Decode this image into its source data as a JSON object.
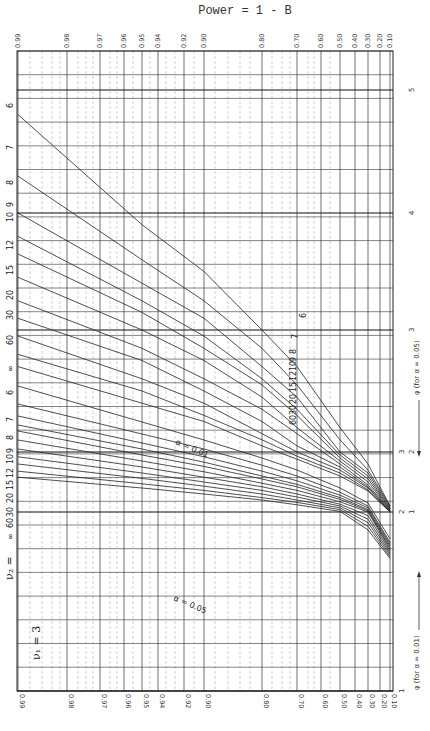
{
  "title": "Power = 1 - B",
  "nu1_label": "ν₁ = 3",
  "nu2_label": "ν₂ = ∞ 60 30 20 15 12 10 9 8 7 6",
  "alpha_05_label": "α = 0.05",
  "alpha_01_label": "α = 0.01",
  "phi_05_label": "φ (for α = 0.05)",
  "phi_01_label": "φ (for α = 0.01)",
  "colors": {
    "line": "#222222",
    "grid_major": "#333333",
    "grid_minor": "#888888",
    "background": "#ffffff"
  },
  "chart_data": {
    "type": "line",
    "subtitle": "Pearson–Hartley power chart, ν₁ = 3 (rotated 90°)",
    "xlabel": "Power = 1 - β",
    "ylabel": "φ",
    "power_ticks_top": [
      "0.99",
      "0.98",
      "0.97",
      "0.96",
      "0.95",
      "0.94",
      "0.92",
      "0.90",
      "0.80",
      "0.70",
      "0.60",
      "0.50",
      "0.40",
      "0.30",
      "0.20",
      "0.10"
    ],
    "power_ticks_bottom": [
      "0.99",
      "0.98",
      "0.97",
      "0.96",
      "0.95",
      "0.94",
      "0.92",
      "0.90",
      "0.80",
      "0.70",
      "0.60",
      "0.50",
      "0.40",
      "0.30",
      "0.20",
      "0.10"
    ],
    "phi_ticks_alpha_01": [
      "1",
      "2",
      "3"
    ],
    "phi_ticks_alpha_05": [
      "1",
      "2",
      "3",
      "4",
      "5"
    ],
    "nu1": 3,
    "nu2_values": [
      "6",
      "7",
      "8",
      "9",
      "10",
      "12",
      "15",
      "20",
      "30",
      "60",
      "∞"
    ],
    "series_groups": [
      {
        "alpha": 0.05,
        "label": "α = 0.05",
        "series": [
          {
            "name": "6",
            "points": [
              [
                0.99,
                4.8
              ],
              [
                0.95,
                3.9
              ],
              [
                0.9,
                3.5
              ],
              [
                0.8,
                3.0
              ],
              [
                0.7,
                2.7
              ],
              [
                0.5,
                2.2
              ],
              [
                0.3,
                1.8
              ],
              [
                0.1,
                1.1
              ]
            ]
          },
          {
            "name": "7",
            "points": [
              [
                0.99,
                4.3
              ],
              [
                0.95,
                3.6
              ],
              [
                0.9,
                3.25
              ],
              [
                0.8,
                2.85
              ],
              [
                0.7,
                2.55
              ],
              [
                0.5,
                2.1
              ],
              [
                0.3,
                1.7
              ],
              [
                0.1,
                1.1
              ]
            ]
          },
          {
            "name": "8",
            "points": [
              [
                0.99,
                4.0
              ],
              [
                0.95,
                3.4
              ],
              [
                0.9,
                3.1
              ],
              [
                0.8,
                2.7
              ],
              [
                0.7,
                2.45
              ],
              [
                0.5,
                2.0
              ],
              [
                0.3,
                1.65
              ],
              [
                0.1,
                1.08
              ]
            ]
          },
          {
            "name": "9",
            "points": [
              [
                0.99,
                3.8
              ],
              [
                0.95,
                3.25
              ],
              [
                0.9,
                2.95
              ],
              [
                0.8,
                2.6
              ],
              [
                0.7,
                2.35
              ],
              [
                0.5,
                1.95
              ],
              [
                0.3,
                1.6
              ],
              [
                0.1,
                1.06
              ]
            ]
          },
          {
            "name": "10",
            "points": [
              [
                0.99,
                3.65
              ],
              [
                0.95,
                3.15
              ],
              [
                0.9,
                2.85
              ],
              [
                0.8,
                2.55
              ],
              [
                0.7,
                2.3
              ],
              [
                0.5,
                1.9
              ],
              [
                0.3,
                1.55
              ],
              [
                0.1,
                1.05
              ]
            ]
          },
          {
            "name": "12",
            "points": [
              [
                0.99,
                3.45
              ],
              [
                0.95,
                3.0
              ],
              [
                0.9,
                2.75
              ],
              [
                0.8,
                2.45
              ],
              [
                0.7,
                2.2
              ],
              [
                0.5,
                1.85
              ],
              [
                0.3,
                1.5
              ],
              [
                0.1,
                1.04
              ]
            ]
          },
          {
            "name": "15",
            "points": [
              [
                0.99,
                3.25
              ],
              [
                0.95,
                2.85
              ],
              [
                0.9,
                2.6
              ],
              [
                0.8,
                2.35
              ],
              [
                0.7,
                2.15
              ],
              [
                0.5,
                1.8
              ],
              [
                0.3,
                1.45
              ],
              [
                0.1,
                1.03
              ]
            ]
          },
          {
            "name": "20",
            "points": [
              [
                0.99,
                3.1
              ],
              [
                0.95,
                2.75
              ],
              [
                0.9,
                2.5
              ],
              [
                0.8,
                2.25
              ],
              [
                0.7,
                2.05
              ],
              [
                0.5,
                1.75
              ],
              [
                0.3,
                1.42
              ],
              [
                0.1,
                1.02
              ]
            ]
          },
          {
            "name": "30",
            "points": [
              [
                0.99,
                2.95
              ],
              [
                0.95,
                2.6
              ],
              [
                0.9,
                2.4
              ],
              [
                0.8,
                2.15
              ],
              [
                0.7,
                2.0
              ],
              [
                0.5,
                1.7
              ],
              [
                0.3,
                1.4
              ],
              [
                0.1,
                1.01
              ]
            ]
          },
          {
            "name": "60",
            "points": [
              [
                0.99,
                2.8
              ],
              [
                0.95,
                2.5
              ],
              [
                0.9,
                2.3
              ],
              [
                0.8,
                2.1
              ],
              [
                0.7,
                1.93
              ],
              [
                0.5,
                1.65
              ],
              [
                0.3,
                1.37
              ],
              [
                0.1,
                1.0
              ]
            ]
          },
          {
            "name": "∞",
            "points": [
              [
                0.99,
                2.7
              ],
              [
                0.95,
                2.4
              ],
              [
                0.9,
                2.25
              ],
              [
                0.8,
                2.05
              ],
              [
                0.7,
                1.88
              ],
              [
                0.5,
                1.6
              ],
              [
                0.3,
                1.35
              ],
              [
                0.1,
                1.0
              ]
            ]
          }
        ]
      },
      {
        "alpha": 0.01,
        "label": "α = 0.01",
        "series": [
          {
            "name": "6",
            "points": [
              [
                0.99,
                4.1
              ],
              [
                0.95,
                3.5
              ],
              [
                0.9,
                3.2
              ],
              [
                0.8,
                2.9
              ],
              [
                0.7,
                2.7
              ],
              [
                0.5,
                2.4
              ],
              [
                0.3,
                2.15
              ],
              [
                0.1,
                1.85
              ]
            ]
          },
          {
            "name": "7",
            "points": [
              [
                0.99,
                3.8
              ],
              [
                0.95,
                3.3
              ],
              [
                0.9,
                3.05
              ],
              [
                0.8,
                2.78
              ],
              [
                0.7,
                2.6
              ],
              [
                0.5,
                2.33
              ],
              [
                0.3,
                2.1
              ],
              [
                0.1,
                1.83
              ]
            ]
          },
          {
            "name": "8",
            "points": [
              [
                0.99,
                3.6
              ],
              [
                0.95,
                3.15
              ],
              [
                0.9,
                2.92
              ],
              [
                0.8,
                2.68
              ],
              [
                0.7,
                2.52
              ],
              [
                0.5,
                2.28
              ],
              [
                0.3,
                2.07
              ],
              [
                0.1,
                1.82
              ]
            ]
          },
          {
            "name": "9",
            "points": [
              [
                0.99,
                3.45
              ],
              [
                0.95,
                3.05
              ],
              [
                0.9,
                2.83
              ],
              [
                0.8,
                2.6
              ],
              [
                0.7,
                2.46
              ],
              [
                0.5,
                2.24
              ],
              [
                0.3,
                2.04
              ],
              [
                0.1,
                1.81
              ]
            ]
          },
          {
            "name": "10",
            "points": [
              [
                0.99,
                3.35
              ],
              [
                0.95,
                2.95
              ],
              [
                0.9,
                2.76
              ],
              [
                0.8,
                2.55
              ],
              [
                0.7,
                2.42
              ],
              [
                0.5,
                2.21
              ],
              [
                0.3,
                2.02
              ],
              [
                0.1,
                1.8
              ]
            ]
          },
          {
            "name": "12",
            "points": [
              [
                0.99,
                3.2
              ],
              [
                0.95,
                2.85
              ],
              [
                0.9,
                2.67
              ],
              [
                0.8,
                2.48
              ],
              [
                0.7,
                2.36
              ],
              [
                0.5,
                2.17
              ],
              [
                0.3,
                2.0
              ],
              [
                0.1,
                1.79
              ]
            ]
          },
          {
            "name": "15",
            "points": [
              [
                0.99,
                3.05
              ],
              [
                0.95,
                2.75
              ],
              [
                0.9,
                2.58
              ],
              [
                0.8,
                2.42
              ],
              [
                0.7,
                2.3
              ],
              [
                0.5,
                2.13
              ],
              [
                0.3,
                1.98
              ],
              [
                0.1,
                1.78
              ]
            ]
          },
          {
            "name": "20",
            "points": [
              [
                0.99,
                2.92
              ],
              [
                0.95,
                2.65
              ],
              [
                0.9,
                2.5
              ],
              [
                0.8,
                2.36
              ],
              [
                0.7,
                2.25
              ],
              [
                0.5,
                2.1
              ],
              [
                0.3,
                1.96
              ],
              [
                0.1,
                1.77
              ]
            ]
          },
          {
            "name": "30",
            "points": [
              [
                0.99,
                2.8
              ],
              [
                0.95,
                2.56
              ],
              [
                0.9,
                2.43
              ],
              [
                0.8,
                2.3
              ],
              [
                0.7,
                2.2
              ],
              [
                0.5,
                2.07
              ],
              [
                0.3,
                1.94
              ],
              [
                0.1,
                1.76
              ]
            ]
          },
          {
            "name": "60",
            "points": [
              [
                0.99,
                2.68
              ],
              [
                0.95,
                2.47
              ],
              [
                0.9,
                2.36
              ],
              [
                0.8,
                2.24
              ],
              [
                0.7,
                2.16
              ],
              [
                0.5,
                2.04
              ],
              [
                0.3,
                1.92
              ],
              [
                0.1,
                1.75
              ]
            ]
          },
          {
            "name": "∞",
            "points": [
              [
                0.99,
                2.58
              ],
              [
                0.95,
                2.4
              ],
              [
                0.9,
                2.3
              ],
              [
                0.8,
                2.2
              ],
              [
                0.7,
                2.12
              ],
              [
                0.5,
                2.01
              ],
              [
                0.3,
                1.9
              ],
              [
                0.1,
                1.74
              ]
            ]
          }
        ]
      }
    ],
    "grid": true,
    "legend_position": "none"
  }
}
